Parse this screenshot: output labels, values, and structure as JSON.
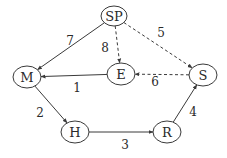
{
  "diagram": {
    "type": "directed-graph",
    "colors": {
      "stroke": "#3a3a3a",
      "text": "#2a2a2a",
      "background": "#ffffff"
    },
    "nodes": [
      {
        "id": "SP",
        "label": "SP",
        "cx": 114,
        "cy": 16,
        "rx": 13,
        "ry": 10
      },
      {
        "id": "M",
        "label": "M",
        "cx": 27,
        "cy": 77,
        "rx": 14,
        "ry": 11
      },
      {
        "id": "E",
        "label": "E",
        "cx": 121,
        "cy": 74,
        "rx": 14,
        "ry": 11
      },
      {
        "id": "S",
        "label": "S",
        "cx": 203,
        "cy": 75,
        "rx": 14,
        "ry": 11
      },
      {
        "id": "H",
        "label": "H",
        "cx": 75,
        "cy": 132,
        "rx": 14,
        "ry": 11
      },
      {
        "id": "R",
        "label": "R",
        "cx": 167,
        "cy": 132,
        "rx": 14,
        "ry": 11
      }
    ],
    "edges": [
      {
        "from": "E",
        "to": "M",
        "label": "1",
        "style": "solid",
        "lx": 77,
        "ly": 88
      },
      {
        "from": "M",
        "to": "H",
        "label": "2",
        "style": "solid",
        "lx": 40,
        "ly": 113
      },
      {
        "from": "H",
        "to": "R",
        "label": "3",
        "style": "solid",
        "lx": 125,
        "ly": 145
      },
      {
        "from": "R",
        "to": "S",
        "label": "4",
        "style": "solid",
        "lx": 193,
        "ly": 112
      },
      {
        "from": "SP",
        "to": "S",
        "label": "5",
        "style": "dashed",
        "lx": 161,
        "ly": 33
      },
      {
        "from": "S",
        "to": "E",
        "label": "6",
        "style": "dashed",
        "lx": 155,
        "ly": 82
      },
      {
        "from": "SP",
        "to": "M",
        "label": "7",
        "style": "solid",
        "lx": 70,
        "ly": 41
      },
      {
        "from": "SP",
        "to": "E",
        "label": "8",
        "style": "dashed",
        "lx": 105,
        "ly": 48
      }
    ]
  }
}
